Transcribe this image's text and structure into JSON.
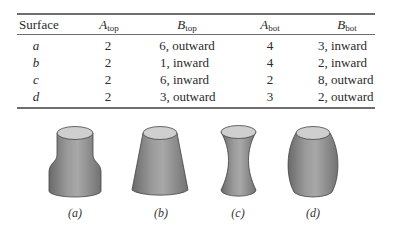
{
  "table": {
    "columns": [
      {
        "label": "Surface",
        "base": "",
        "sub": ""
      },
      {
        "label": "A_top",
        "base": "A",
        "sub": "top"
      },
      {
        "label": "B_top",
        "base": "B",
        "sub": "top"
      },
      {
        "label": "A_bot",
        "base": "A",
        "sub": "bot"
      },
      {
        "label": "B_bot",
        "base": "B",
        "sub": "bot"
      }
    ],
    "header_surface": "Surface",
    "rows": [
      {
        "surface": "a",
        "a_top": "2",
        "b_top": "6, outward",
        "a_bot": "4",
        "b_bot": "3, inward"
      },
      {
        "surface": "b",
        "a_top": "2",
        "b_top": "1, inward",
        "a_bot": "4",
        "b_bot": "2, inward"
      },
      {
        "surface": "c",
        "a_top": "2",
        "b_top": "6, inward",
        "a_bot": "2",
        "b_bot": "8, outward"
      },
      {
        "surface": "d",
        "a_top": "2",
        "b_top": "3, outward",
        "a_bot": "3",
        "b_bot": "2, outward"
      }
    ]
  },
  "figure": {
    "shapes": [
      {
        "id": "a",
        "label": "(a)",
        "description": "cylinder narrow on top, flaring to wider base"
      },
      {
        "id": "b",
        "label": "(b)",
        "description": "truncated cone widening toward bottom"
      },
      {
        "id": "c",
        "label": "(c)",
        "description": "hourglass-shaped surface pinched in the middle"
      },
      {
        "id": "d",
        "label": "(d)",
        "description": "barrel-shaped surface bulging outward"
      }
    ]
  }
}
